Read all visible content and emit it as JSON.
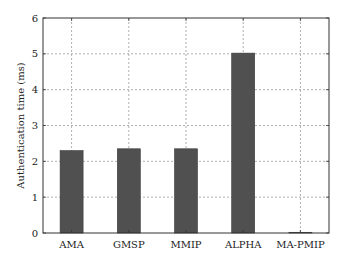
{
  "chart_data": {
    "type": "bar",
    "title": "",
    "xlabel": "",
    "ylabel": "Authentication time (ms)",
    "categories": [
      "AMA",
      "GMSP",
      "MMIP",
      "ALPHA",
      "MA-PMIP"
    ],
    "values": [
      2.3,
      2.35,
      2.35,
      5.02,
      0.02
    ],
    "ylim": [
      0,
      6
    ],
    "yticks": [
      0,
      1,
      2,
      3,
      4,
      5,
      6
    ],
    "grid": true,
    "grid_style": "dotted",
    "legend": null,
    "bar_color": "#505050"
  }
}
